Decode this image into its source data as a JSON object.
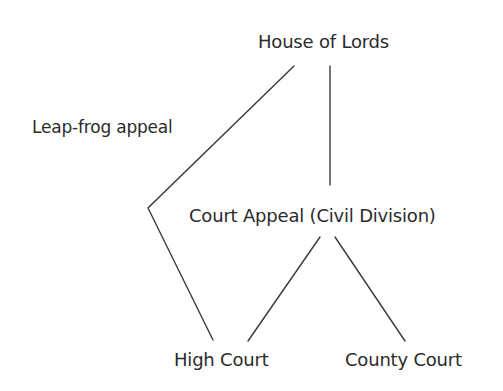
{
  "diagram": {
    "type": "court-hierarchy",
    "background": "#ffffff",
    "line_color": "#3a3a3a",
    "text_color": "#2b2b2b",
    "nodes": [
      {
        "id": "lords",
        "label": "House of Lords"
      },
      {
        "id": "appeal",
        "label": "Court Appeal (Civil Division)"
      },
      {
        "id": "high",
        "label": "High Court"
      },
      {
        "id": "county",
        "label": "County Court"
      }
    ],
    "edge_labels": [
      {
        "id": "leapfrog",
        "label": "Leap-frog appeal",
        "edge": "high-lords"
      }
    ],
    "edges": [
      {
        "from": "lords",
        "to": "appeal",
        "label": ""
      },
      {
        "from": "appeal",
        "to": "high",
        "label": ""
      },
      {
        "from": "appeal",
        "to": "county",
        "label": ""
      },
      {
        "from": "high",
        "to": "lords",
        "label": "Leap-frog appeal",
        "bent": true
      }
    ]
  }
}
